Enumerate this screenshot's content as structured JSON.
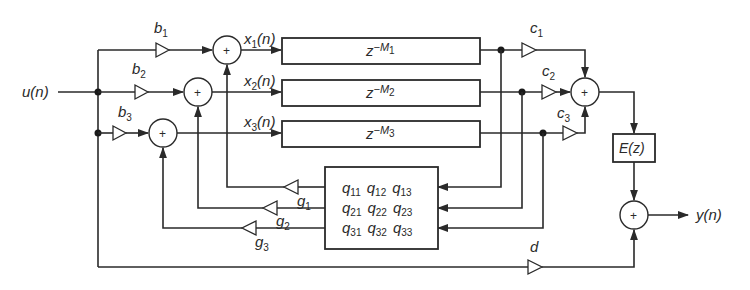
{
  "diagram": {
    "type": "signal-flow block diagram (feedback delay network)",
    "input": {
      "label": "u(n)"
    },
    "output": {
      "label": "y(n)"
    },
    "input_gains": [
      {
        "name": "b",
        "sub": "1"
      },
      {
        "name": "b",
        "sub": "2"
      },
      {
        "name": "b",
        "sub": "3"
      }
    ],
    "state_signals": [
      {
        "name": "x",
        "sub": "1",
        "arg": "(n)"
      },
      {
        "name": "x",
        "sub": "2",
        "arg": "(n)"
      },
      {
        "name": "x",
        "sub": "3",
        "arg": "(n)"
      }
    ],
    "delays": [
      {
        "base": "z",
        "exp": "−M",
        "sub": "1"
      },
      {
        "base": "z",
        "exp": "−M",
        "sub": "2"
      },
      {
        "base": "z",
        "exp": "−M",
        "sub": "3"
      }
    ],
    "output_gains": [
      {
        "name": "c",
        "sub": "1"
      },
      {
        "name": "c",
        "sub": "2"
      },
      {
        "name": "c",
        "sub": "3"
      }
    ],
    "feedback_gains": [
      {
        "name": "g",
        "sub": "1"
      },
      {
        "name": "g",
        "sub": "2"
      },
      {
        "name": "g",
        "sub": "3"
      }
    ],
    "feedback_matrix": [
      [
        {
          "name": "q",
          "sub": "11"
        },
        {
          "name": "q",
          "sub": "12"
        },
        {
          "name": "q",
          "sub": "13"
        }
      ],
      [
        {
          "name": "q",
          "sub": "21"
        },
        {
          "name": "q",
          "sub": "22"
        },
        {
          "name": "q",
          "sub": "23"
        }
      ],
      [
        {
          "name": "q",
          "sub": "31"
        },
        {
          "name": "q",
          "sub": "32"
        },
        {
          "name": "q",
          "sub": "33"
        }
      ]
    ],
    "filter": {
      "label": "E(z)"
    },
    "direct_gain": {
      "label": "d"
    },
    "summer_symbol": "+"
  }
}
